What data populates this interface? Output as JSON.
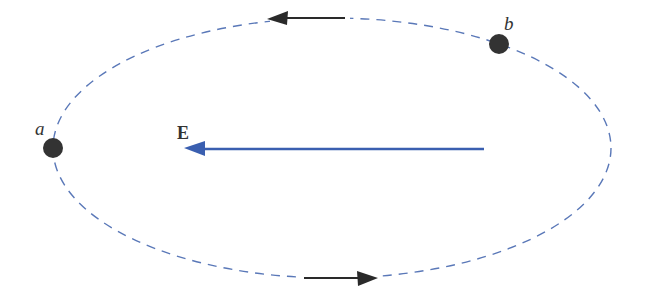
{
  "diagram": {
    "labels": {
      "point_a": "a",
      "point_b": "b",
      "field": "E"
    },
    "colors": {
      "orbit": "#5a78b8",
      "field_arrow": "#3a5fb0",
      "points": "#333333",
      "orbit_arrows": "#2a2a2a"
    },
    "orbit": {
      "cx": 332,
      "cy": 148,
      "rx": 279,
      "ry": 130,
      "style": "dashed"
    },
    "points": [
      {
        "name": "a",
        "x": 53,
        "y": 148
      },
      {
        "name": "b",
        "x": 499,
        "y": 44
      }
    ],
    "orbit_arrows": [
      {
        "position": "top",
        "direction": "left"
      },
      {
        "position": "bottom",
        "direction": "right"
      }
    ],
    "field_arrow": {
      "x1": 484,
      "y1": 149,
      "x2": 186,
      "y2": 149,
      "direction": "left"
    }
  }
}
